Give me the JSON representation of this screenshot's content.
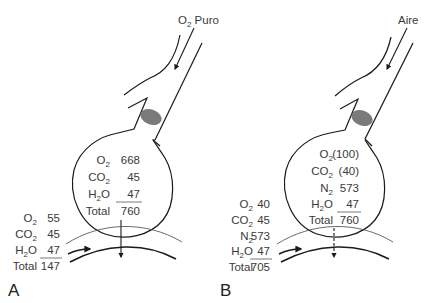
{
  "panels": [
    {
      "label": "A",
      "source": "O",
      "source_sub": "2",
      "source_suffix": " Puro",
      "alveolus": {
        "rows": [
          {
            "gas": "O",
            "sub": "2",
            "value": "668"
          },
          {
            "gas": "CO",
            "sub": "2",
            "value": "45"
          },
          {
            "gas": "H",
            "sub": "2",
            "gas_suffix": "O",
            "value": "47"
          }
        ],
        "total_label": "Total",
        "total_value": "760"
      },
      "blood": {
        "rows": [
          {
            "gas": "O",
            "sub": "2",
            "value": "55"
          },
          {
            "gas": "CO",
            "sub": "2",
            "value": "45"
          },
          {
            "gas": "H",
            "sub": "2",
            "gas_suffix": "O",
            "value": "47"
          }
        ],
        "total_label": "Total",
        "total_value": "147"
      },
      "diffusion_arrow": "solid"
    },
    {
      "label": "B",
      "source": "Aire",
      "source_sub": "",
      "source_suffix": "",
      "alveolus": {
        "rows": [
          {
            "gas": "O",
            "sub": "2",
            "value": "(100)"
          },
          {
            "gas": "CO",
            "sub": "2",
            "value": "(40)"
          },
          {
            "gas": "N",
            "sub": "2",
            "value": "573"
          },
          {
            "gas": "H",
            "sub": "2",
            "gas_suffix": "O",
            "value": "47"
          }
        ],
        "total_label": "Total",
        "total_value": "760"
      },
      "blood": {
        "rows": [
          {
            "gas": "O",
            "sub": "2",
            "value": "40"
          },
          {
            "gas": "CO",
            "sub": "2",
            "value": "45"
          },
          {
            "gas": "N",
            "sub": "2",
            "value": "573"
          },
          {
            "gas": "H",
            "sub": "2",
            "gas_suffix": "O",
            "value": "47"
          }
        ],
        "total_label": "Total",
        "total_value": "705"
      },
      "diffusion_arrow": "dashed"
    }
  ],
  "colors": {
    "line": "#1a1a1a",
    "text": "#3a3a3a",
    "obstruction": "#7a7a7a"
  }
}
